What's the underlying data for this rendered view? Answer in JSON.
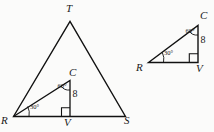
{
  "figure": {
    "stroke_color": "#111111",
    "background_color": "#fbfbfa",
    "large_figure": {
      "name": "triangle-RTS-with-inner-RCV",
      "vertices": {
        "T": "T",
        "R": "R",
        "S": "S",
        "C": "C",
        "V": "V"
      },
      "angles": {
        "R": "30°",
        "C": "60°"
      },
      "side_lengths": {
        "CV": "8"
      },
      "right_angle_at": "V"
    },
    "small_figure": {
      "name": "triangle-RCV",
      "vertices": {
        "C": "C",
        "R": "R",
        "V": "V"
      },
      "angles": {
        "R": "30°",
        "C": "60°"
      },
      "side_lengths": {
        "CV": "8"
      },
      "right_angle_at": "V"
    }
  }
}
